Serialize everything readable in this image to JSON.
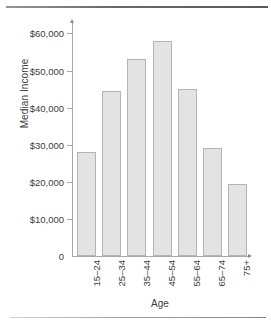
{
  "chart_data": {
    "type": "bar",
    "title": "",
    "xlabel": "Age",
    "ylabel": "Median Income",
    "categories": [
      "15–24",
      "25–34",
      "35–44",
      "45–54",
      "55–64",
      "65–74",
      "75+"
    ],
    "values": [
      28000,
      44500,
      53000,
      58000,
      45000,
      29000,
      19500
    ],
    "ylim": [
      0,
      62000
    ],
    "yticks": [
      0,
      10000,
      20000,
      30000,
      40000,
      50000,
      60000
    ],
    "ytick_labels": [
      "0",
      "$10,000",
      "$20,000",
      "$30,000",
      "$40,000",
      "$50,000",
      "$60,000"
    ],
    "grid": false,
    "legend": null,
    "bar_color": "#e3e3e3",
    "bar_border_color": "#b4b4b4",
    "axis_color": "#a9a9a9",
    "text_color": "#3d3d3d"
  }
}
